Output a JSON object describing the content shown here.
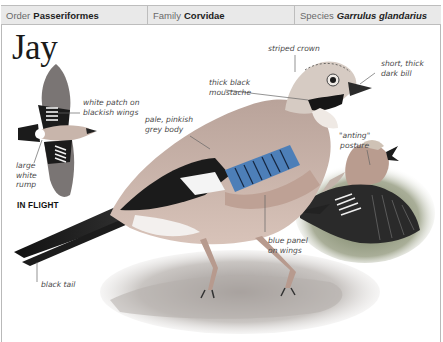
{
  "header": {
    "order_label": "Order",
    "order_value": "Passeriformes",
    "family_label": "Family",
    "family_value": "Corvidae",
    "species_label": "Species",
    "species_value": "Garrulus glandarius"
  },
  "title": "Jay",
  "flight_caption": "IN FLIGHT",
  "annotations": {
    "white_patch": [
      "white patch on",
      "blackish wings"
    ],
    "large_rump": [
      "large",
      "white",
      "rump"
    ],
    "pale_body": [
      "pale, pinkish",
      "grey body"
    ],
    "moustache": [
      "thick black",
      "moustache"
    ],
    "striped_crown": "striped crown",
    "bill": [
      "short, thick",
      "dark bill"
    ],
    "anting": [
      "\"anting\"",
      "posture"
    ],
    "blue_panel": [
      "blue panel",
      "on wings"
    ],
    "black_tail": "black tail"
  },
  "colors": {
    "header_bg": "#e9e9e9",
    "border": "#bdbdbd",
    "body": "#c7a99c",
    "blue_panel": "#4d7fb8",
    "black": "#1b1b1b"
  }
}
